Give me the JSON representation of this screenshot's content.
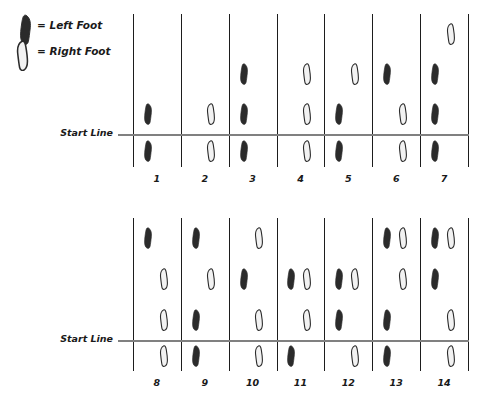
{
  "legend": {
    "items": [
      {
        "icon": "left-foot-icon",
        "text": "= Left Foot",
        "foot": "left"
      },
      {
        "icon": "right-foot-icon",
        "text": "= Right Foot",
        "foot": "right"
      }
    ]
  },
  "colors": {
    "left_foot_fill": "#2b2b2b",
    "right_foot_fill": "#f2f2f2",
    "foot_outline": "#2b2b2b",
    "grid_line": "#1d1d1d",
    "start_line": "#808080",
    "text": "#1a1a1a",
    "background": "#ffffff"
  },
  "panels": [
    {
      "id": "panel-top",
      "start_line_label": "Start Line",
      "rows": 4,
      "start_line_after_row": 3,
      "columns": [
        {
          "number": "1",
          "feet": [
            {
              "row": 3,
              "side": "left",
              "foot": "left"
            },
            {
              "row": 4,
              "side": "left",
              "foot": "left"
            }
          ]
        },
        {
          "number": "2",
          "feet": [
            {
              "row": 3,
              "side": "right",
              "foot": "right"
            },
            {
              "row": 4,
              "side": "right",
              "foot": "right"
            }
          ]
        },
        {
          "number": "3",
          "feet": [
            {
              "row": 2,
              "side": "left",
              "foot": "left"
            },
            {
              "row": 3,
              "side": "left",
              "foot": "left"
            },
            {
              "row": 4,
              "side": "left",
              "foot": "left"
            }
          ]
        },
        {
          "number": "4",
          "feet": [
            {
              "row": 2,
              "side": "right",
              "foot": "right"
            },
            {
              "row": 3,
              "side": "right",
              "foot": "right"
            },
            {
              "row": 4,
              "side": "right",
              "foot": "right"
            }
          ]
        },
        {
          "number": "5",
          "feet": [
            {
              "row": 2,
              "side": "right",
              "foot": "right"
            },
            {
              "row": 3,
              "side": "left",
              "foot": "left"
            },
            {
              "row": 4,
              "side": "left",
              "foot": "left"
            }
          ]
        },
        {
          "number": "6",
          "feet": [
            {
              "row": 2,
              "side": "left",
              "foot": "left"
            },
            {
              "row": 3,
              "side": "right",
              "foot": "right"
            },
            {
              "row": 4,
              "side": "right",
              "foot": "right"
            }
          ]
        },
        {
          "number": "7",
          "feet": [
            {
              "row": 1,
              "side": "right",
              "foot": "right"
            },
            {
              "row": 2,
              "side": "left",
              "foot": "left"
            },
            {
              "row": 3,
              "side": "left",
              "foot": "left"
            },
            {
              "row": 4,
              "side": "left",
              "foot": "left"
            }
          ]
        }
      ]
    },
    {
      "id": "panel-bottom",
      "start_line_label": "Start Line",
      "rows": 4,
      "start_line_after_row": 3,
      "columns": [
        {
          "number": "8",
          "feet": [
            {
              "row": 1,
              "side": "left",
              "foot": "left"
            },
            {
              "row": 2,
              "side": "right",
              "foot": "right"
            },
            {
              "row": 3,
              "side": "right",
              "foot": "right"
            },
            {
              "row": 4,
              "side": "right",
              "foot": "right"
            }
          ]
        },
        {
          "number": "9",
          "feet": [
            {
              "row": 1,
              "side": "left",
              "foot": "left"
            },
            {
              "row": 2,
              "side": "right",
              "foot": "right"
            },
            {
              "row": 3,
              "side": "left",
              "foot": "left"
            },
            {
              "row": 4,
              "side": "left",
              "foot": "left"
            }
          ]
        },
        {
          "number": "10",
          "feet": [
            {
              "row": 1,
              "side": "right",
              "foot": "right"
            },
            {
              "row": 2,
              "side": "left",
              "foot": "left"
            },
            {
              "row": 3,
              "side": "right",
              "foot": "right"
            },
            {
              "row": 4,
              "side": "right",
              "foot": "right"
            }
          ]
        },
        {
          "number": "11",
          "feet": [
            {
              "row": 2,
              "side": "left",
              "foot": "left"
            },
            {
              "row": 2,
              "side": "right",
              "foot": "right"
            },
            {
              "row": 3,
              "side": "right",
              "foot": "right"
            },
            {
              "row": 4,
              "side": "left",
              "foot": "left"
            }
          ]
        },
        {
          "number": "12",
          "feet": [
            {
              "row": 2,
              "side": "left",
              "foot": "left"
            },
            {
              "row": 2,
              "side": "right",
              "foot": "right"
            },
            {
              "row": 3,
              "side": "left",
              "foot": "left"
            },
            {
              "row": 4,
              "side": "right",
              "foot": "right"
            }
          ]
        },
        {
          "number": "13",
          "feet": [
            {
              "row": 1,
              "side": "left",
              "foot": "left"
            },
            {
              "row": 1,
              "side": "right",
              "foot": "right"
            },
            {
              "row": 2,
              "side": "right",
              "foot": "right"
            },
            {
              "row": 3,
              "side": "left",
              "foot": "left"
            },
            {
              "row": 4,
              "side": "left",
              "foot": "left"
            }
          ]
        },
        {
          "number": "14",
          "feet": [
            {
              "row": 1,
              "side": "left",
              "foot": "left"
            },
            {
              "row": 1,
              "side": "right",
              "foot": "right"
            },
            {
              "row": 2,
              "side": "left",
              "foot": "left"
            },
            {
              "row": 3,
              "side": "right",
              "foot": "right"
            },
            {
              "row": 4,
              "side": "right",
              "foot": "right"
            }
          ]
        }
      ]
    }
  ],
  "geometry": {
    "grid_left": 133,
    "grid_right": 468,
    "panel_top_y": 14,
    "panel_top_bottom": 167,
    "panel_top_startline_y": 134,
    "panel_bottom_y": 218,
    "panel_bottom_bottom": 371,
    "panel_bottom_startline_y": 340
  }
}
